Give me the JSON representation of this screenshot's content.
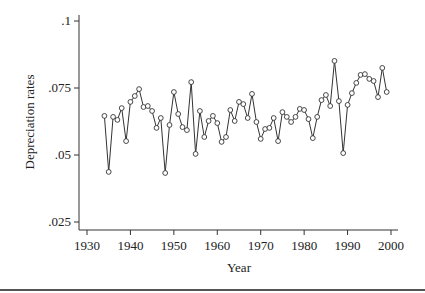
{
  "chart_data": {
    "type": "line",
    "title": "",
    "xlabel": "Year",
    "ylabel": "Depreciation rates",
    "xlim": [
      1930,
      2000
    ],
    "ylim": [
      0.025,
      0.1
    ],
    "x_ticks": [
      1930,
      1940,
      1950,
      1960,
      1970,
      1980,
      1990,
      2000
    ],
    "x_tick_labels": [
      "1930",
      "1940",
      "1950",
      "1960",
      "1970",
      "1980",
      "1990",
      "2000"
    ],
    "y_ticks": [
      0.025,
      0.05,
      0.075,
      0.1
    ],
    "y_tick_labels": [
      ".025",
      ".05",
      ".075",
      ".1"
    ],
    "grid": false,
    "legend": null,
    "markers": "hollow-circle",
    "series": [
      {
        "name": "Depreciation rates",
        "x": [
          1934,
          1935,
          1936,
          1937,
          1938,
          1939,
          1940,
          1941,
          1942,
          1943,
          1944,
          1945,
          1946,
          1947,
          1948,
          1949,
          1950,
          1951,
          1952,
          1953,
          1954,
          1955,
          1956,
          1957,
          1958,
          1959,
          1960,
          1961,
          1962,
          1963,
          1964,
          1965,
          1966,
          1967,
          1968,
          1969,
          1970,
          1971,
          1972,
          1973,
          1974,
          1975,
          1976,
          1977,
          1978,
          1979,
          1980,
          1981,
          1982,
          1983,
          1984,
          1985,
          1986,
          1987,
          1988,
          1989,
          1990,
          1991,
          1992,
          1993,
          1994,
          1995,
          1996,
          1997,
          1998,
          1999
        ],
        "values": [
          0.0646,
          0.0437,
          0.0642,
          0.0631,
          0.0675,
          0.0552,
          0.0698,
          0.072,
          0.0746,
          0.0679,
          0.0683,
          0.0664,
          0.0601,
          0.0638,
          0.0433,
          0.0612,
          0.0735,
          0.0653,
          0.0604,
          0.0593,
          0.0772,
          0.0504,
          0.0664,
          0.0567,
          0.0627,
          0.0646,
          0.0619,
          0.0549,
          0.0567,
          0.0668,
          0.0627,
          0.0698,
          0.069,
          0.0638,
          0.0728,
          0.0623,
          0.056,
          0.0597,
          0.0601,
          0.0638,
          0.0552,
          0.066,
          0.0642,
          0.0623,
          0.0642,
          0.0672,
          0.0668,
          0.0634,
          0.0563,
          0.0642,
          0.0705,
          0.0724,
          0.0683,
          0.0851,
          0.0701,
          0.0507,
          0.0687,
          0.0731,
          0.0769,
          0.0799,
          0.0802,
          0.0784,
          0.0776,
          0.0716,
          0.0825,
          0.0735
        ]
      }
    ]
  },
  "style": {
    "line_color": "#333333",
    "axis_color": "#333333",
    "background": "#ffffff"
  }
}
